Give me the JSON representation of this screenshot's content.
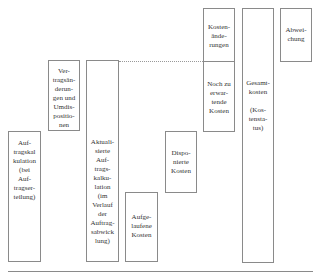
{
  "diagram": {
    "boxes": [
      {
        "id": "auftragskalkulation",
        "label": "Auf-\ntragskal\nkulation\n(bei\nAuf-\ntragser-\nteilung)"
      },
      {
        "id": "vertragsaenderungen",
        "label": "Ver-\ntragsän-\nderun-\ngen und\nUmdis-\npositio-\nnen"
      },
      {
        "id": "aktualisierte",
        "label": "Aktuali-\nsierte\nAuf-\ntrags-\nkalku-\nlation\n(im\nVerlauf\nder\nAuftrag-\nsabwick\nlung)"
      },
      {
        "id": "aufgelaufene",
        "label": "Aufge-\nlaufene\nKosten"
      },
      {
        "id": "disponierte",
        "label": "Dispo-\nnierte\nKosten"
      },
      {
        "id": "kostenaenderungen",
        "label": "Kosten-\nände-\nrungen"
      },
      {
        "id": "noch-zu-erwartende",
        "label": "Noch zu\nerwar-\ntende\nKosten"
      },
      {
        "id": "gesamtkosten",
        "label": "Gesamt-\nkosten\n\n(Kos-\ntensta-\ntus)"
      },
      {
        "id": "abweichung",
        "label": "Abwei-\nchung"
      }
    ]
  }
}
